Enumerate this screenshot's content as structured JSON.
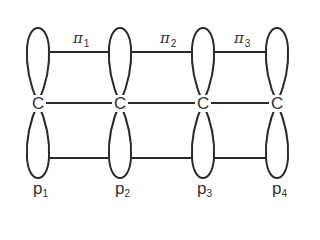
{
  "diagram": {
    "title": "",
    "stroke_color": "#2a2a2a",
    "atoms": [
      {
        "symbol": "C",
        "orbital": "p",
        "index": "1"
      },
      {
        "symbol": "C",
        "orbital": "p",
        "index": "2"
      },
      {
        "symbol": "C",
        "orbital": "p",
        "index": "3"
      },
      {
        "symbol": "C",
        "orbital": "p",
        "index": "4"
      }
    ],
    "bonds": [
      {
        "symbol": "π",
        "index": "1"
      },
      {
        "symbol": "π",
        "index": "2"
      },
      {
        "symbol": "π",
        "index": "3"
      }
    ]
  }
}
